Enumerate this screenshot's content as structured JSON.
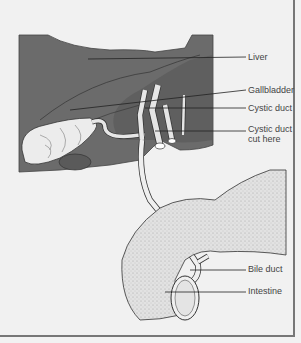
{
  "diagram": {
    "colors": {
      "background": "#f1f1f1",
      "liver": "#6b6b6b",
      "liver_dark": "#555555",
      "duct": "#e6e6e6",
      "intestine": "#dcdcdc",
      "outline": "#333333",
      "leader": "#222222",
      "label_text": "#444444",
      "frame": "#777777"
    },
    "labels": [
      {
        "id": "liver",
        "text": "Liver",
        "top": 52
      },
      {
        "id": "gallbladder",
        "text": "Gallbladder",
        "top": 85
      },
      {
        "id": "cystic-duct",
        "text": "Cystic duct",
        "top": 103
      },
      {
        "id": "cystic-duct-cut",
        "text": "Cystic duct",
        "text2": "cut here",
        "top": 124
      },
      {
        "id": "bile-duct",
        "text": "Bile duct",
        "top": 264
      },
      {
        "id": "intestine",
        "text": "Intestine",
        "top": 286
      }
    ]
  }
}
